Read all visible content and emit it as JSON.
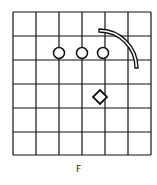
{
  "figure": {
    "label": "F",
    "grid": {
      "rows": 6,
      "cols": 6,
      "x_lines": [
        13,
        36,
        59,
        82,
        105,
        128,
        151
      ],
      "y_lines": [
        12,
        36,
        60,
        84,
        108,
        132,
        155
      ],
      "line_color": "#111111"
    },
    "shapes": [
      {
        "type": "circle",
        "cx": 59,
        "cy": 53,
        "r": 5.5
      },
      {
        "type": "circle",
        "cx": 82,
        "cy": 53,
        "r": 5.5
      },
      {
        "type": "circle",
        "cx": 103,
        "cy": 53,
        "r": 5.5
      },
      {
        "type": "diamond",
        "cx": 100,
        "cy": 97,
        "half": 7
      },
      {
        "type": "arc-band",
        "cx": 99,
        "cy": 68,
        "r_outer": 39,
        "r_inner": 36
      }
    ]
  }
}
